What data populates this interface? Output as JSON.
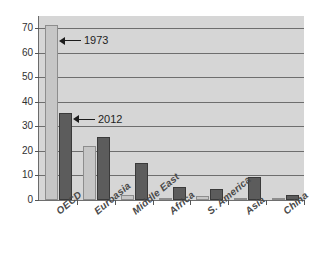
{
  "chart_data": {
    "type": "bar",
    "title": "",
    "subtitle": "",
    "xlabel": "",
    "ylabel": "",
    "ylim": [
      0,
      75
    ],
    "yticks": [
      0,
      10,
      20,
      30,
      40,
      50,
      60,
      70
    ],
    "ytick_labels": [
      "0",
      "10",
      "20",
      "30",
      "40",
      "50",
      "60",
      "70"
    ],
    "grid": true,
    "legend_position": "none",
    "categories": [
      "OECD",
      "Euroasia",
      "Middle East",
      "Africa",
      "S. America",
      "Asia",
      "China"
    ],
    "series": [
      {
        "name": "1973",
        "color": "#c6c6c6",
        "values": [
          71.5,
          22.0,
          2.0,
          0.8,
          1.5,
          0.6,
          0.2
        ]
      },
      {
        "name": "2012",
        "color": "#5c5c5c",
        "values": [
          35.5,
          25.5,
          15.0,
          5.3,
          4.4,
          9.3,
          2.2
        ]
      }
    ],
    "annotations": [
      {
        "text": "1973",
        "target_series": "1973",
        "target_category": "OECD",
        "value": 65
      },
      {
        "text": "2012",
        "target_series": "2012",
        "target_category": "OECD",
        "value": 33
      }
    ]
  },
  "colors": {
    "plot_background": "#d6d6d6",
    "gridline": "#6e6e6e",
    "axis": "#6b6b6b",
    "series_1973": "#c6c6c6",
    "series_2012": "#5c5c5c",
    "annotation": "#1c1c1c",
    "page_background": "#ffffff"
  }
}
